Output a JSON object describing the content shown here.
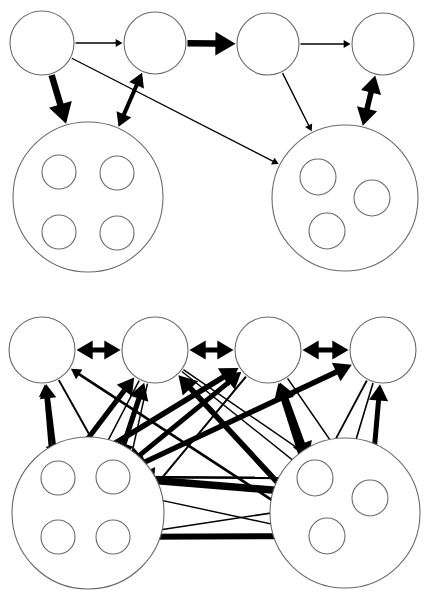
{
  "figure": {
    "title": "",
    "background_color": "#ffffff",
    "edge_color": "#000000",
    "node_stroke_color": "#6b6b6b",
    "width": 428,
    "height": 596,
    "panels": [
      {
        "name": "top-panel",
        "label": "",
        "y_offset": 0
      },
      {
        "name": "bottom-panel",
        "label": "",
        "y_offset": 300
      }
    ]
  },
  "diagram_data": {
    "type": "diagram",
    "description": "Two hierarchical network diagrams of circular nodes and two large cluster circles each containing small sub-nodes, connected by thin and thick directed and bidirectional arrows.",
    "panels": [
      {
        "id": "top",
        "name": "sparse-network",
        "nodes": [
          {
            "id": "t1",
            "label": "",
            "cx": 42,
            "cy": 43,
            "r": 32,
            "kind": "top-node"
          },
          {
            "id": "t2",
            "label": "",
            "cx": 155,
            "cy": 43,
            "r": 31,
            "kind": "top-node"
          },
          {
            "id": "t3",
            "label": "",
            "cx": 268,
            "cy": 44,
            "r": 31,
            "kind": "top-node"
          },
          {
            "id": "t4",
            "label": "",
            "cx": 383,
            "cy": 44,
            "r": 31,
            "kind": "top-node"
          },
          {
            "id": "cL",
            "label": "",
            "cx": 88,
            "cy": 197,
            "r": 75,
            "kind": "cluster"
          },
          {
            "id": "cR",
            "label": "",
            "cx": 345,
            "cy": 198,
            "r": 73,
            "kind": "cluster"
          },
          {
            "id": "cL_tl",
            "label": "",
            "cx": 59,
            "cy": 172,
            "r": 17,
            "kind": "inner",
            "parent": "cL"
          },
          {
            "id": "cL_tr",
            "label": "",
            "cx": 117,
            "cy": 173,
            "r": 17,
            "kind": "inner",
            "parent": "cL"
          },
          {
            "id": "cL_bl",
            "label": "",
            "cx": 59,
            "cy": 232,
            "r": 17,
            "kind": "inner",
            "parent": "cL"
          },
          {
            "id": "cL_br",
            "label": "",
            "cx": 117,
            "cy": 233,
            "r": 17,
            "kind": "inner",
            "parent": "cL"
          },
          {
            "id": "cR_t",
            "label": "",
            "cx": 318,
            "cy": 177,
            "r": 18,
            "kind": "inner",
            "parent": "cR"
          },
          {
            "id": "cR_r",
            "label": "",
            "cx": 372,
            "cy": 198,
            "r": 18,
            "kind": "inner",
            "parent": "cR"
          },
          {
            "id": "cR_b",
            "label": "",
            "cx": 327,
            "cy": 231,
            "r": 18,
            "kind": "inner",
            "parent": "cR"
          }
        ],
        "edges": [
          {
            "from": "t1",
            "to": "t2",
            "weight": 1.4,
            "dir": "forward"
          },
          {
            "from": "t2",
            "to": "t3",
            "weight": 6.5,
            "dir": "forward"
          },
          {
            "from": "t3",
            "to": "t4",
            "weight": 1.4,
            "dir": "forward"
          },
          {
            "from": "t1",
            "to": "cL",
            "weight": 6.5,
            "dir": "forward"
          },
          {
            "from": "t2",
            "to": "cL",
            "weight": 4.0,
            "dir": "both"
          },
          {
            "from": "t1",
            "to": "cR",
            "weight": 1.3,
            "dir": "forward"
          },
          {
            "from": "t3",
            "to": "cR",
            "weight": 1.4,
            "dir": "forward"
          },
          {
            "from": "t4",
            "to": "cR",
            "weight": 5.5,
            "dir": "both"
          },
          {
            "from": "cL_tl",
            "to": "cL_tr",
            "weight": 4.2,
            "dir": "forward"
          },
          {
            "from": "cL_tl",
            "to": "cL_bl",
            "weight": 5.2,
            "dir": "forward"
          },
          {
            "from": "cL_bl",
            "to": "cL_br",
            "weight": 1.6,
            "dir": "forward"
          },
          {
            "from": "cR_t",
            "to": "cR_r",
            "weight": 2.6,
            "dir": "both"
          },
          {
            "from": "cR_r",
            "to": "cR_b",
            "weight": 2.2,
            "dir": "both"
          },
          {
            "from": "cR_t",
            "to": "cR_b",
            "weight": 1.6,
            "dir": "both"
          }
        ]
      },
      {
        "id": "bottom",
        "name": "dense-network",
        "nodes": [
          {
            "id": "b1",
            "label": "",
            "cx": 42,
            "cy": 350,
            "r": 33,
            "kind": "top-node"
          },
          {
            "id": "b2",
            "label": "",
            "cx": 155,
            "cy": 350,
            "r": 33,
            "kind": "top-node"
          },
          {
            "id": "b3",
            "label": "",
            "cx": 268,
            "cy": 350,
            "r": 33,
            "kind": "top-node"
          },
          {
            "id": "b4",
            "label": "",
            "cx": 383,
            "cy": 350,
            "r": 33,
            "kind": "top-node"
          },
          {
            "id": "dL",
            "label": "",
            "cx": 88,
            "cy": 513,
            "r": 76,
            "kind": "cluster"
          },
          {
            "id": "dR",
            "label": "",
            "cx": 345,
            "cy": 513,
            "r": 75,
            "kind": "cluster"
          },
          {
            "id": "dL_tl",
            "label": "",
            "cx": 58,
            "cy": 478,
            "r": 17,
            "kind": "inner",
            "parent": "dL"
          },
          {
            "id": "dL_tr",
            "label": "",
            "cx": 113,
            "cy": 477,
            "r": 17,
            "kind": "inner",
            "parent": "dL"
          },
          {
            "id": "dL_bl",
            "label": "",
            "cx": 58,
            "cy": 537,
            "r": 17,
            "kind": "inner",
            "parent": "dL"
          },
          {
            "id": "dL_br",
            "label": "",
            "cx": 113,
            "cy": 537,
            "r": 17,
            "kind": "inner",
            "parent": "dL"
          },
          {
            "id": "dR_t",
            "label": "",
            "cx": 315,
            "cy": 478,
            "r": 18,
            "kind": "inner",
            "parent": "dR"
          },
          {
            "id": "dR_r",
            "label": "",
            "cx": 370,
            "cy": 498,
            "r": 18,
            "kind": "inner",
            "parent": "dR"
          },
          {
            "id": "dR_b",
            "label": "",
            "cx": 327,
            "cy": 536,
            "r": 18,
            "kind": "inner",
            "parent": "dR"
          }
        ],
        "edges": [
          {
            "from": "b1",
            "to": "b2",
            "weight": 5.0,
            "dir": "both"
          },
          {
            "from": "b2",
            "to": "b3",
            "weight": 5.0,
            "dir": "both"
          },
          {
            "from": "b3",
            "to": "b4",
            "weight": 5.0,
            "dir": "both"
          },
          {
            "from": "b1",
            "to": "dL_tl",
            "weight": 4.2,
            "dir": "both"
          },
          {
            "from": "b1",
            "to": "dL_tr",
            "weight": 2.0,
            "dir": "forward"
          },
          {
            "from": "b1",
            "to": "dL_bl",
            "weight": 3.4,
            "dir": "both"
          },
          {
            "from": "b1",
            "to": "dR_b",
            "weight": 2.6,
            "dir": "both"
          },
          {
            "from": "b2",
            "to": "dL_tl",
            "weight": 5.0,
            "dir": "both"
          },
          {
            "from": "b2",
            "to": "dL_tr",
            "weight": 5.2,
            "dir": "both"
          },
          {
            "from": "b2",
            "to": "dL_bl",
            "weight": 1.5,
            "dir": "forward"
          },
          {
            "from": "b2",
            "to": "dL_br",
            "weight": 1.5,
            "dir": "forward"
          },
          {
            "from": "b2",
            "to": "dR_t",
            "weight": 1.4,
            "dir": "forward"
          },
          {
            "from": "b2",
            "to": "dR_r",
            "weight": 1.4,
            "dir": "forward"
          },
          {
            "from": "b2",
            "to": "dR_b",
            "weight": 5.6,
            "dir": "both"
          },
          {
            "from": "b3",
            "to": "dL_tl",
            "weight": 5.6,
            "dir": "both"
          },
          {
            "from": "b3",
            "to": "dL_tr",
            "weight": 5.0,
            "dir": "both"
          },
          {
            "from": "b3",
            "to": "dL_br",
            "weight": 2.0,
            "dir": "forward"
          },
          {
            "from": "b3",
            "to": "dR_t",
            "weight": 5.4,
            "dir": "both"
          },
          {
            "from": "b3",
            "to": "dR_r",
            "weight": 1.6,
            "dir": "forward"
          },
          {
            "from": "b3",
            "to": "dR_b",
            "weight": 5.6,
            "dir": "both"
          },
          {
            "from": "b4",
            "to": "dL_tr",
            "weight": 5.4,
            "dir": "both"
          },
          {
            "from": "b4",
            "to": "dR_t",
            "weight": 1.8,
            "dir": "forward"
          },
          {
            "from": "b4",
            "to": "dR_r",
            "weight": 5.0,
            "dir": "both"
          },
          {
            "from": "b4",
            "to": "dR_b",
            "weight": 1.6,
            "dir": "forward"
          },
          {
            "from": "dL_tl",
            "to": "dL_tr",
            "weight": 2.2,
            "dir": "both"
          },
          {
            "from": "dL_tl",
            "to": "dL_bl",
            "weight": 5.4,
            "dir": "both"
          },
          {
            "from": "dL_tl",
            "to": "dL_br",
            "weight": 4.2,
            "dir": "both"
          },
          {
            "from": "dL_tr",
            "to": "dL_bl",
            "weight": 4.2,
            "dir": "both"
          },
          {
            "from": "dL_tr",
            "to": "dL_br",
            "weight": 5.4,
            "dir": "both"
          },
          {
            "from": "dL_bl",
            "to": "dL_br",
            "weight": 2.2,
            "dir": "both"
          },
          {
            "from": "dR_t",
            "to": "dR_r",
            "weight": 2.6,
            "dir": "both"
          },
          {
            "from": "dR_t",
            "to": "dR_b",
            "weight": 2.6,
            "dir": "both"
          },
          {
            "from": "dR_r",
            "to": "dR_b",
            "weight": 3.0,
            "dir": "both"
          },
          {
            "from": "dL_tr",
            "to": "dR_t",
            "weight": 2.6,
            "dir": "forward"
          },
          {
            "from": "dL_tr",
            "to": "dR_r",
            "weight": 7.5,
            "dir": "both"
          },
          {
            "from": "dL_br",
            "to": "dR_r",
            "weight": 1.6,
            "dir": "forward"
          },
          {
            "from": "dL_br",
            "to": "dR_b",
            "weight": 6.0,
            "dir": "both"
          },
          {
            "from": "dL_bl",
            "to": "dR_b",
            "weight": 1.6,
            "dir": "forward"
          },
          {
            "from": "dL_tl",
            "to": "dR_b",
            "weight": 1.4,
            "dir": "forward"
          }
        ]
      }
    ]
  }
}
